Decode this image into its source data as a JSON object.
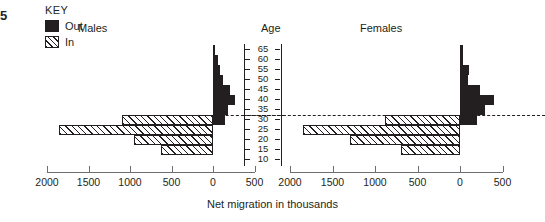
{
  "figure": {
    "edge_marker": "5",
    "axis_title": "Net migration in thousands",
    "age_axis_title": "Age",
    "panels": [
      {
        "id": "males",
        "label": "Males"
      },
      {
        "id": "females",
        "label": "Females"
      }
    ]
  },
  "key": {
    "title": "KEY",
    "items": [
      {
        "label": "Out",
        "pattern": "solid-black",
        "color": "#231f20"
      },
      {
        "label": "In",
        "pattern": "diagonal-hatch",
        "color": "#231f20"
      }
    ]
  },
  "x_axis": {
    "tick_labels": [
      "2000",
      "1500",
      "1000",
      "500",
      "0",
      "500"
    ],
    "units": "thousands",
    "title": "Net migration in thousands"
  },
  "age_axis": {
    "title": "Age",
    "tick_labels": [
      "65",
      "60",
      "55",
      "50",
      "45",
      "40",
      "35",
      "30",
      "25",
      "20",
      "15",
      "10"
    ]
  },
  "chart_data": {
    "type": "bar",
    "orientation": "horizontal",
    "title": "Net migration in thousands",
    "subtitle": "",
    "xlabel": "Net migration in thousands",
    "ylabel": "Age",
    "grid": false,
    "legend_position": "top-left",
    "legend_title": "KEY",
    "legend": [
      "Out",
      "In"
    ],
    "categories": [
      "65",
      "60",
      "55",
      "50",
      "45",
      "40",
      "35",
      "30",
      "25",
      "20",
      "15",
      "10"
    ],
    "xlim_left_panel": [
      2000,
      -500
    ],
    "xlim_right_panel": [
      2000,
      -500
    ],
    "xticks": [
      2000,
      1500,
      1000,
      500,
      0,
      500
    ],
    "note": "Bars to the right of zero are 'Out' (solid); bars to the left of zero are 'In' (hatched). Values in thousands.",
    "panels": [
      {
        "name": "Males",
        "series": [
          {
            "name": "Out",
            "direction": "right-of-zero",
            "values": [
              30,
              60,
              90,
              120,
              200,
              260,
              180,
              150,
              0,
              0,
              0,
              0
            ]
          },
          {
            "name": "In",
            "direction": "left-of-zero",
            "values": [
              0,
              0,
              0,
              0,
              0,
              0,
              0,
              1100,
              1850,
              950,
              630,
              0
            ]
          }
        ]
      },
      {
        "name": "Females",
        "series": [
          {
            "name": "Out",
            "direction": "right-of-zero",
            "values": [
              30,
              40,
              110,
              90,
              230,
              400,
              290,
              200,
              0,
              0,
              0,
              0
            ]
          },
          {
            "name": "In",
            "direction": "left-of-zero",
            "values": [
              0,
              0,
              0,
              0,
              0,
              0,
              0,
              880,
              1850,
              1300,
              700,
              0
            ]
          }
        ]
      }
    ]
  }
}
